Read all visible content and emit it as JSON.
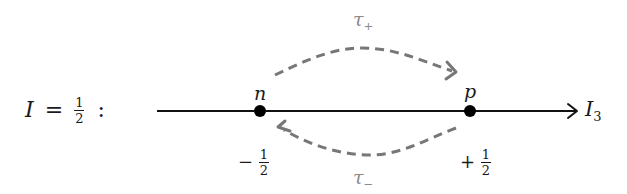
{
  "diagram": {
    "title_equation": {
      "lhs": "I",
      "equals": "=",
      "fraction": {
        "numerator": "1",
        "denominator": "2"
      },
      "suffix": ":"
    },
    "axis": {
      "label_main": "I",
      "label_sub": "3",
      "color": "#111111"
    },
    "nodes": [
      {
        "id": "n",
        "label": "n",
        "value_sign": "−",
        "value_fraction": {
          "numerator": "1",
          "denominator": "2"
        }
      },
      {
        "id": "p",
        "label": "p",
        "value_sign": "+",
        "value_fraction": {
          "numerator": "1",
          "denominator": "2"
        }
      }
    ],
    "transitions": [
      {
        "id": "tau_plus",
        "label_main": "τ",
        "label_sub": "+",
        "from": "n",
        "to": "p",
        "style": "dashed",
        "color": "#777777"
      },
      {
        "id": "tau_minus",
        "label_main": "τ",
        "label_sub": "−",
        "from": "p",
        "to": "n",
        "style": "dashed",
        "color": "#777777"
      }
    ]
  }
}
